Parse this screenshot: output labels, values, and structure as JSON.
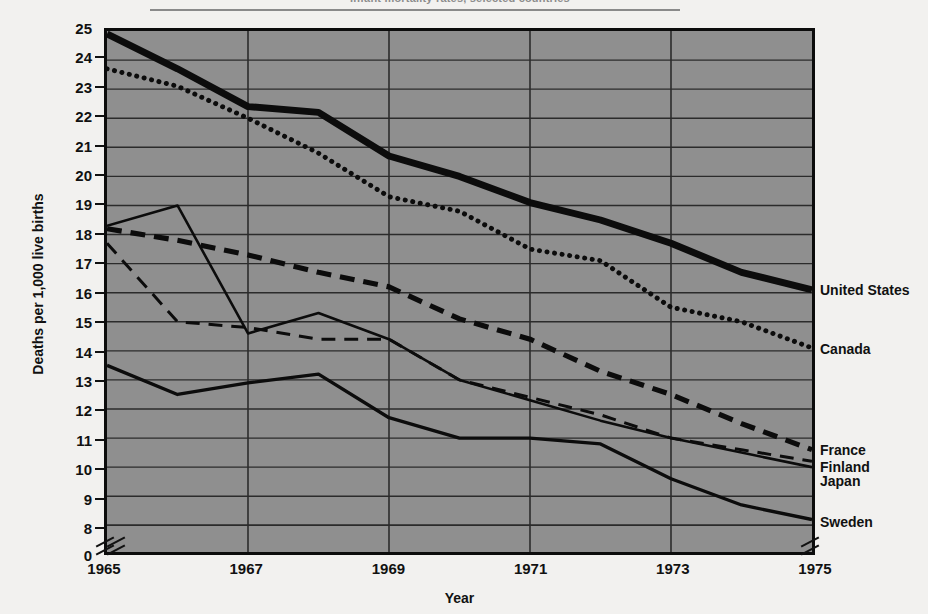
{
  "title": "Infant mortality rates, selected countries",
  "axes": {
    "ylabel": "Deaths per 1,000 live births",
    "xlabel": "Year",
    "yticks": [
      "25",
      "24",
      "23",
      "22",
      "21",
      "20",
      "19",
      "18",
      "17",
      "16",
      "15",
      "14",
      "13",
      "12",
      "11",
      "10",
      "9",
      "8",
      "0"
    ],
    "xticks": [
      "1965",
      "1967",
      "1969",
      "1971",
      "1973",
      "1975"
    ]
  },
  "series_labels": {
    "united_states": "United States",
    "canada": "Canada",
    "france": "France",
    "finland": "Finland",
    "japan": "Japan",
    "sweden": "Sweden"
  },
  "colors": {
    "plot_background": "#8f8f8f",
    "page_background": "#f2f1ef",
    "ink": "#0c0c0c",
    "gridline": "#2b2b2b",
    "title": "#8d8d8d"
  },
  "chart_data": {
    "type": "line",
    "title": "Infant mortality rates, selected countries",
    "xlabel": "Year",
    "ylabel": "Deaths per 1,000 live births",
    "x": [
      1965,
      1966,
      1967,
      1968,
      1969,
      1970,
      1971,
      1972,
      1973,
      1974,
      1975
    ],
    "xlim": [
      1965,
      1975
    ],
    "ylim": [
      8,
      25
    ],
    "y_axis_break": true,
    "y_axis_break_value": 0,
    "grid": true,
    "legend_position": "right-inline",
    "series": [
      {
        "name": "United States",
        "style": "solid-heavy",
        "values": [
          24.9,
          23.7,
          22.4,
          22.2,
          20.7,
          20.0,
          19.1,
          18.5,
          17.7,
          16.7,
          16.1
        ]
      },
      {
        "name": "Canada",
        "style": "dotted",
        "values": [
          23.7,
          23.1,
          22.0,
          20.8,
          19.3,
          18.8,
          17.5,
          17.1,
          15.5,
          15.0,
          14.1
        ]
      },
      {
        "name": "France",
        "style": "dashed-heavy",
        "values": [
          18.2,
          17.8,
          17.3,
          16.7,
          16.2,
          15.1,
          14.4,
          13.3,
          12.5,
          11.5,
          10.6
        ]
      },
      {
        "name": "Finland",
        "style": "dashed-thin",
        "values": [
          17.7,
          15.0,
          14.8,
          14.4,
          14.4,
          13.0,
          12.4,
          11.8,
          11.0,
          10.6,
          10.2
        ]
      },
      {
        "name": "Japan",
        "style": "solid-thin",
        "values": [
          18.3,
          19.0,
          14.6,
          15.3,
          14.4,
          13.0,
          12.3,
          11.6,
          11.0,
          10.5,
          10.0
        ]
      },
      {
        "name": "Sweden",
        "style": "solid-medium",
        "values": [
          13.5,
          12.5,
          12.9,
          13.2,
          11.7,
          11.0,
          11.0,
          10.8,
          9.6,
          8.7,
          8.2
        ]
      }
    ]
  }
}
